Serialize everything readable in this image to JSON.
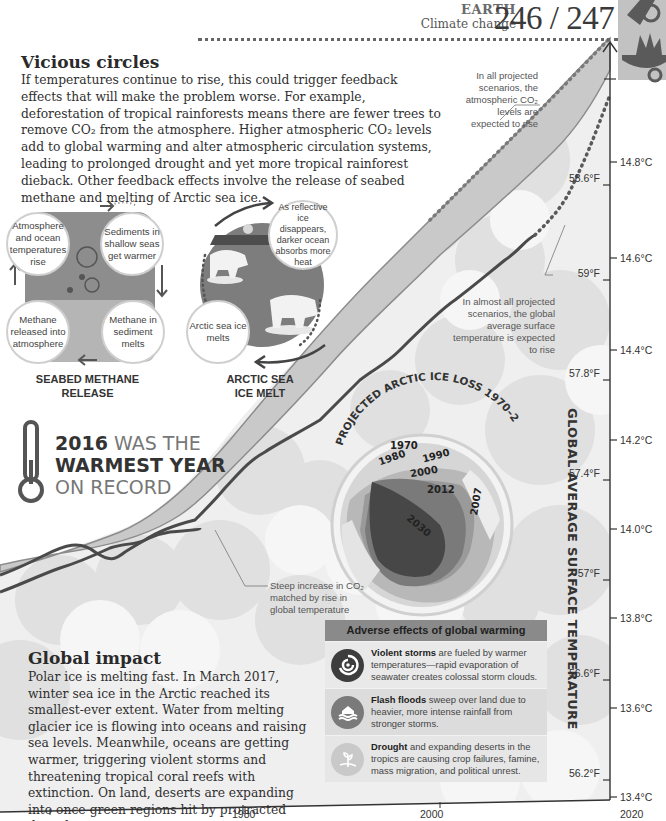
{
  "header": {
    "section": "EARTH",
    "subsection": "Climate change",
    "pages": "246 / 247"
  },
  "vicious_circles": {
    "title": "Vicious circles",
    "body": "If temperatures continue to rise, this could trigger feedback effects that will make the problem worse. For example, deforestation of tropical rainforests means there are fewer trees to remove CO₂ from the atmosphere. Higher atmospheric CO₂ levels add to global warming and alter atmospheric circulation systems, leading to prolonged drought and yet more tropical rainforest dieback. Other feedback effects involve the release of seabed methane and melting of Arctic sea ice."
  },
  "seabed_cycle": {
    "label_line1": "SEABED METHANE",
    "label_line2": "RELEASE",
    "steps": [
      "Atmosphere and ocean temperatures rise",
      "Sediments in shallow seas get warmer",
      "Methane in sediment melts",
      "Methane released into atmosphere"
    ]
  },
  "arctic_cycle": {
    "label_line1": "ARCTIC SEA",
    "label_line2": "ICE MELT",
    "steps": [
      "As reflective ice disappears, darker ocean absorbs more heat",
      "Arctic sea ice melts"
    ]
  },
  "record": {
    "year": "2016",
    "line1_rest": " WAS THE",
    "line2": "WARMEST YEAR",
    "line3": "ON RECORD"
  },
  "annotations": {
    "co2_projection": "In all projected scenarios, the atmospheric CO₂ levels are expected to rise",
    "temp_projection": "In almost all projected scenarios, the global average surface temperature is expected to rise",
    "steep_increase": "Steep increase in CO₂ matched by rise in global temperature"
  },
  "arctic_map": {
    "title": "PROJECTED ARCTIC ICE LOSS 1970–2030",
    "years": [
      "1970",
      "1980",
      "1990",
      "2000",
      "2012",
      "2007",
      "2030"
    ]
  },
  "global_impact": {
    "title": "Global impact",
    "body": "Polar ice is melting fast. In March 2017, winter sea ice in the Arctic reached its smallest-ever extent. Water from melting glacier ice is flowing into oceans and raising sea levels. Meanwhile, oceans are getting warmer, triggering violent storms and threatening tropical coral reefs with extinction. On land, deserts are expanding into once-green regions hit by protracted droughts."
  },
  "adverse_effects": {
    "title": "Adverse effects of global warming",
    "items": [
      {
        "icon": "storm-icon",
        "bold": "Violent storms",
        "text": " are fueled by warmer temperatures—rapid evaporation of seawater creates colossal storm clouds."
      },
      {
        "icon": "flood-icon",
        "bold": "Flash floods",
        "text": " sweep over land due to heavier, more intense rainfall from stronger storms."
      },
      {
        "icon": "drought-icon",
        "bold": "Drought",
        "text": " and expanding deserts in the tropics are causing crop failures, famine, mass migration, and political unrest."
      }
    ]
  },
  "chart_data": {
    "type": "line",
    "title": "",
    "ylabel": "GLOBAL AVERAGE SURFACE TEMPERATURE",
    "xlabel": "",
    "x_ticks": [
      "",
      "1980",
      "2000",
      "2020"
    ],
    "y_ticks_celsius": [
      "14.8°C",
      "14.6°C",
      "14.4°C",
      "14.2°C",
      "14.0°C",
      "13.8°C",
      "13.6°C",
      "13.4°C"
    ],
    "y_ticks_fahrenheit": [
      "58.6°F",
      "59°F",
      "57.8°F",
      "57.4°F",
      "57°F",
      "56.6°F",
      "56.2°F"
    ],
    "ylim_celsius": [
      13.4,
      14.9
    ],
    "series": [
      {
        "name": "Atmospheric CO₂ (band)",
        "style": "projected dotted after 2020"
      },
      {
        "name": "Global average surface temperature",
        "style": "solid dark line, projected dotted after 2020"
      }
    ]
  },
  "axis": {
    "c_labels": [
      {
        "t": "14.8°C",
        "y": 158
      },
      {
        "t": "14.6°C",
        "y": 254
      },
      {
        "t": "14.4°C",
        "y": 346
      },
      {
        "t": "14.2°C",
        "y": 436
      },
      {
        "t": "14.0°C",
        "y": 525
      },
      {
        "t": "13.8°C",
        "y": 614
      },
      {
        "t": "13.6°C",
        "y": 704
      },
      {
        "t": "13.4°C",
        "y": 793
      }
    ],
    "f_labels": [
      {
        "t": "58.6°F",
        "y": 180
      },
      {
        "t": "59°F",
        "y": 275
      },
      {
        "t": "57.8°F",
        "y": 375
      },
      {
        "t": "57.4°F",
        "y": 475
      },
      {
        "t": "57°F",
        "y": 575
      },
      {
        "t": "56.6°F",
        "y": 675
      },
      {
        "t": "56.2°F",
        "y": 775
      }
    ],
    "x_labels": [
      {
        "t": "1980",
        "x": 232
      },
      {
        "t": "2000",
        "x": 420
      },
      {
        "t": "2020",
        "x": 620
      }
    ]
  },
  "colors": {
    "co2_band": "#c9c9c9",
    "temp_line": "#4a4a4a",
    "cloud_light": "#ebebeb",
    "cloud_mid": "#dcdcdc",
    "header_band": "#8a8a8a"
  }
}
